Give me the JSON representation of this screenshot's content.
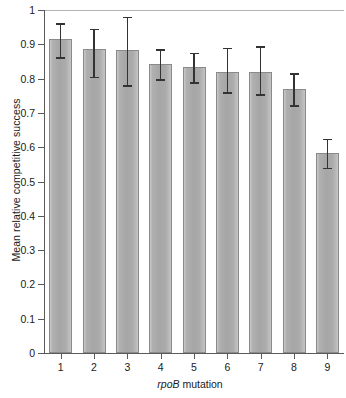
{
  "chart_data": {
    "type": "bar",
    "title": "",
    "xlabel": "rpoB mutation",
    "xlabel_italic_part": "rpoB",
    "xlabel_plain_part": " mutation",
    "ylabel": "Mean relative competitive success",
    "categories": [
      "1",
      "2",
      "3",
      "4",
      "5",
      "6",
      "7",
      "8",
      "9"
    ],
    "values": [
      0.915,
      0.885,
      0.882,
      0.842,
      0.835,
      0.82,
      0.82,
      0.77,
      0.583
    ],
    "error_upper": [
      0.962,
      0.945,
      0.98,
      0.885,
      0.875,
      0.89,
      0.895,
      0.815,
      0.625
    ],
    "error_lower": [
      0.862,
      0.805,
      0.78,
      0.798,
      0.79,
      0.76,
      0.755,
      0.722,
      0.54
    ],
    "ylim": [
      0,
      1
    ],
    "yticks": [
      0,
      0.1,
      0.2,
      0.3,
      0.4,
      0.5,
      0.6,
      0.7,
      0.8,
      0.9,
      1
    ],
    "ytick_labels": [
      "0",
      "0.1",
      "0.2",
      "0.3",
      "0.4",
      "0.5",
      "0.6",
      "0.7",
      "0.8",
      "0.9",
      "1"
    ],
    "grid": false,
    "legend": null,
    "bar_fill_color": "#a9a9a9",
    "bar_edge_color": "#8a8a8a",
    "error_bar_color": "#333333",
    "axis_color": "#5a5a5a"
  }
}
